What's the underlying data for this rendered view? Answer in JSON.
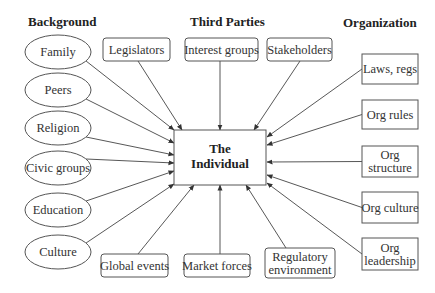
{
  "headers": {
    "background": "Background",
    "third_parties": "Third Parties",
    "organization": "Organization"
  },
  "center": {
    "line1": "The",
    "line2": "Individual"
  },
  "background_items": [
    "Family",
    "Peers",
    "Religion",
    "Civic groups",
    "Education",
    "Culture"
  ],
  "third_parties_top": [
    "Legislators",
    "Interest groups",
    "Stakeholders"
  ],
  "third_parties_bottom": [
    {
      "lines": [
        "Global events"
      ]
    },
    {
      "lines": [
        "Market forces"
      ]
    },
    {
      "lines": [
        "Regulatory",
        "environment"
      ]
    }
  ],
  "organization_items": [
    {
      "lines": [
        "Laws, regs"
      ]
    },
    {
      "lines": [
        "Org rules"
      ]
    },
    {
      "lines": [
        "Org",
        "structure"
      ]
    },
    {
      "lines": [
        "Org culture"
      ]
    },
    {
      "lines": [
        "Org",
        "leadership"
      ]
    }
  ],
  "colors": {
    "stroke": "#555555",
    "text": "#333333",
    "background": "#ffffff"
  }
}
